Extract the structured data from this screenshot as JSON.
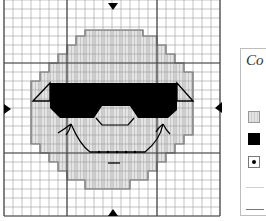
{
  "chart": {
    "type": "cross-stitch-pattern",
    "grid": {
      "columns": 24,
      "rows": 24,
      "cell_px": 9
    },
    "center_markers": [
      "top",
      "bottom",
      "left",
      "right"
    ],
    "colors": {
      "grid_line": "#9a9a9a",
      "grid_major": "#555555",
      "face_fill": "#dcdcdc",
      "face_outline": "#555555",
      "sunglasses": "#000000",
      "background": "#ffffff"
    }
  },
  "legend": {
    "title": "Co",
    "items": [
      {
        "symbol": "light-hatched-square",
        "color": "#dcdcdc"
      },
      {
        "symbol": "solid-black-square",
        "color": "#000000"
      },
      {
        "symbol": "dot-square",
        "color": "#000000"
      },
      {
        "symbol": "light-backstitch-line",
        "color": "#d0d0d0"
      },
      {
        "symbol": "dark-backstitch-line",
        "color": "#777777"
      }
    ]
  }
}
